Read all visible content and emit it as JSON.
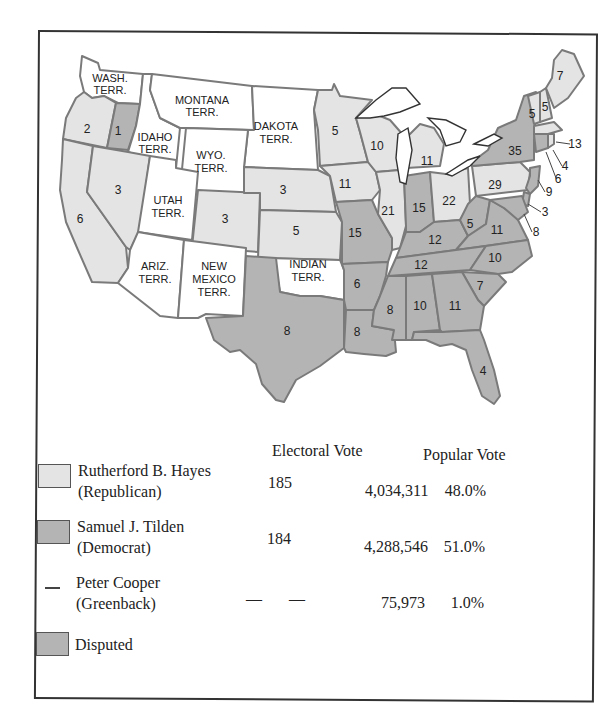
{
  "colors": {
    "hayes": "#e4e4e4",
    "tilden": "#b4b4b4",
    "disputed": "#b4b4b4",
    "territory": "#ffffff",
    "border": "#7a7a7a"
  },
  "map": {
    "territories": [
      {
        "id": "wash",
        "label1": "WASH.",
        "label2": "TERR."
      },
      {
        "id": "montana",
        "label1": "MONTANA",
        "label2": "TERR."
      },
      {
        "id": "idaho",
        "label1": "IDAHO",
        "label2": "TERR."
      },
      {
        "id": "dakota",
        "label1": "DAKOTA",
        "label2": "TERR."
      },
      {
        "id": "wyo",
        "label1": "WYO.",
        "label2": "TERR."
      },
      {
        "id": "utah",
        "label1": "UTAH",
        "label2": "TERR."
      },
      {
        "id": "ariz",
        "label1": "ARIZ.",
        "label2": "TERR."
      },
      {
        "id": "newmexico",
        "label1": "NEW",
        "label2": "MEXICO",
        "label3": "TERR."
      },
      {
        "id": "indian",
        "label1": "INDIAN",
        "label2": "TERR."
      }
    ],
    "states": {
      "oregon": {
        "votes": "2",
        "party": "hayes"
      },
      "oregon_disputed": {
        "votes": "1",
        "party": "disputed"
      },
      "california": {
        "votes": "6",
        "party": "hayes"
      },
      "nevada": {
        "votes": "3",
        "party": "hayes"
      },
      "colorado": {
        "votes": "3",
        "party": "hayes"
      },
      "nebraska": {
        "votes": "3",
        "party": "hayes"
      },
      "kansas": {
        "votes": "5",
        "party": "hayes"
      },
      "minnesota": {
        "votes": "5",
        "party": "hayes"
      },
      "iowa": {
        "votes": "11",
        "party": "hayes"
      },
      "wisconsin": {
        "votes": "10",
        "party": "hayes"
      },
      "illinois": {
        "votes": "21",
        "party": "hayes"
      },
      "michigan": {
        "votes": "11",
        "party": "hayes"
      },
      "ohio": {
        "votes": "22",
        "party": "hayes"
      },
      "pennsylvania": {
        "votes": "29",
        "party": "hayes"
      },
      "newyork": {
        "votes": "35",
        "party": "tilden"
      },
      "vermont": {
        "votes": "5",
        "party": "hayes"
      },
      "newhampshire": {
        "votes": "5",
        "party": "hayes"
      },
      "maine": {
        "votes": "7",
        "party": "hayes"
      },
      "massachusetts": {
        "votes": "13",
        "party": "hayes"
      },
      "rhodeisland": {
        "votes": "4",
        "party": "hayes"
      },
      "connecticut": {
        "votes": "6",
        "party": "tilden"
      },
      "newjersey": {
        "votes": "9",
        "party": "tilden"
      },
      "delaware": {
        "votes": "3",
        "party": "tilden"
      },
      "maryland": {
        "votes": "8",
        "party": "tilden"
      },
      "texas": {
        "votes": "8",
        "party": "tilden"
      },
      "missouri": {
        "votes": "15",
        "party": "tilden"
      },
      "arkansas": {
        "votes": "6",
        "party": "tilden"
      },
      "louisiana": {
        "votes": "8",
        "party": "disputed"
      },
      "indiana": {
        "votes": "15",
        "party": "tilden"
      },
      "kentucky": {
        "votes": "12",
        "party": "tilden"
      },
      "westvirginia": {
        "votes": "5",
        "party": "tilden"
      },
      "virginia": {
        "votes": "11",
        "party": "tilden"
      },
      "tennessee": {
        "votes": "12",
        "party": "tilden"
      },
      "northcarolina": {
        "votes": "10",
        "party": "tilden"
      },
      "southcarolina": {
        "votes": "7",
        "party": "disputed"
      },
      "mississippi": {
        "votes": "8",
        "party": "tilden"
      },
      "alabama": {
        "votes": "10",
        "party": "tilden"
      },
      "georgia": {
        "votes": "11",
        "party": "tilden"
      },
      "florida": {
        "votes": "4",
        "party": "disputed"
      }
    }
  },
  "legend": {
    "headers": {
      "electoral": "Electoral Vote",
      "popular": "Popular Vote"
    },
    "candidates": [
      {
        "name": "Rutherford B. Hayes",
        "party": "(Republican)",
        "electoral": "185",
        "popular": "4,034,311",
        "percent": "48.0%"
      },
      {
        "name": "Samuel J. Tilden",
        "party": "(Democrat)",
        "electoral": "184",
        "popular": "4,288,546",
        "percent": "51.0%"
      },
      {
        "name": "Peter Cooper",
        "party": "(Greenback)",
        "electoral_dash1": "—",
        "electoral_dash2": "—",
        "popular": "75,973",
        "percent": "1.0%"
      }
    ],
    "disputed_label": "Disputed"
  }
}
